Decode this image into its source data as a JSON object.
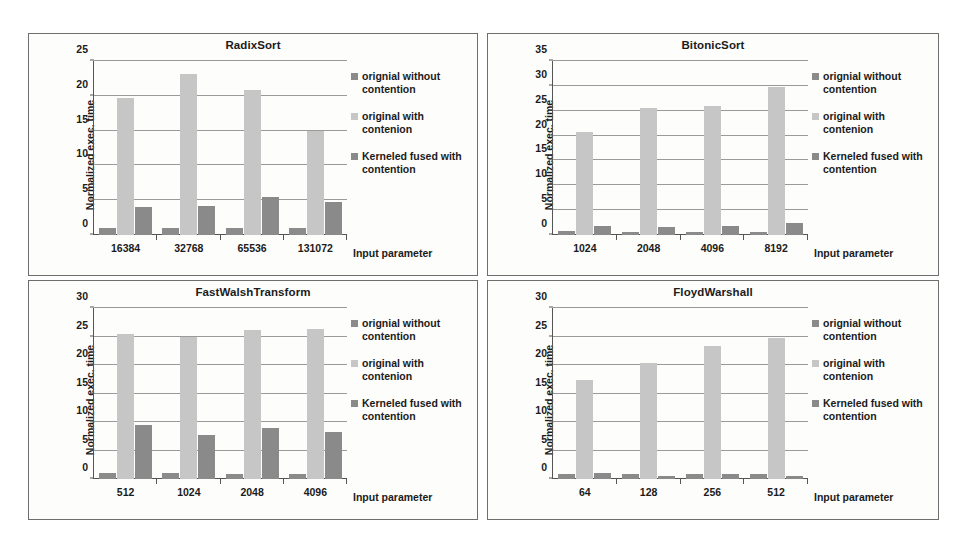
{
  "figure": {
    "panel_count": 4,
    "background_color": "#ffffff",
    "border_color": "#6e6e6e"
  },
  "legend": {
    "position": "right",
    "series": [
      {
        "label": "orignial without contention",
        "color": "#8b8b8b",
        "swatch_name": "legend-swatch-original-without-contention"
      },
      {
        "label": "original with contenion",
        "color": "#c6c6c6",
        "swatch_name": "legend-swatch-original-with-contention"
      },
      {
        "label": "Kerneled fused with contention",
        "color": "#8a8a8a",
        "swatch_name": "legend-swatch-kerneled-fused-with-contention"
      }
    ]
  },
  "chart_data": [
    {
      "type": "bar",
      "title": "RadixSort",
      "xlabel": "Input parameter",
      "ylabel": "Normalized exec. time",
      "categories": [
        "16384",
        "32768",
        "65536",
        "131072"
      ],
      "ylim": [
        0,
        25
      ],
      "yticks": [
        0,
        5,
        10,
        15,
        20,
        25
      ],
      "grid": true,
      "legend_position": "right",
      "series": [
        {
          "name": "orignial without contention",
          "color": "#8b8b8b",
          "values": [
            1.0,
            1.0,
            1.0,
            1.0
          ]
        },
        {
          "name": "original with contenion",
          "color": "#c6c6c6",
          "values": [
            19.7,
            23.1,
            20.9,
            14.9
          ]
        },
        {
          "name": "Kerneled fused with contention",
          "color": "#8a8a8a",
          "values": [
            4.0,
            4.2,
            5.5,
            4.8
          ]
        }
      ]
    },
    {
      "type": "bar",
      "title": "BitonicSort",
      "xlabel": "Input parameter",
      "ylabel": "Normalized exec. time",
      "categories": [
        "1024",
        "2048",
        "4096",
        "8192"
      ],
      "ylim": [
        0,
        35
      ],
      "yticks": [
        0,
        5,
        10,
        15,
        20,
        25,
        30,
        35
      ],
      "grid": true,
      "legend_position": "right",
      "series": [
        {
          "name": "orignial without contention",
          "color": "#8b8b8b",
          "values": [
            0.8,
            0.7,
            0.7,
            0.6
          ]
        },
        {
          "name": "original with contenion",
          "color": "#c6c6c6",
          "values": [
            20.7,
            25.5,
            25.9,
            29.8
          ]
        },
        {
          "name": "Kerneled fused with contention",
          "color": "#8a8a8a",
          "values": [
            1.8,
            1.7,
            1.9,
            2.5
          ]
        }
      ]
    },
    {
      "type": "bar",
      "title": "FastWalshTransform",
      "xlabel": "Input parameter",
      "ylabel": "Normalized exec. time",
      "categories": [
        "512",
        "1024",
        "2048",
        "4096"
      ],
      "ylim": [
        0,
        30
      ],
      "yticks": [
        0,
        5,
        10,
        15,
        20,
        25,
        30
      ],
      "grid": true,
      "legend_position": "right",
      "series": [
        {
          "name": "orignial without contention",
          "color": "#8b8b8b",
          "values": [
            1.0,
            1.0,
            0.95,
            0.85
          ]
        },
        {
          "name": "original with contenion",
          "color": "#c6c6c6",
          "values": [
            25.4,
            24.9,
            26.2,
            26.4
          ]
        },
        {
          "name": "Kerneled fused with contention",
          "color": "#8a8a8a",
          "values": [
            9.4,
            7.8,
            8.9,
            8.2
          ]
        }
      ]
    },
    {
      "type": "bar",
      "title": "FloydWarshall",
      "xlabel": "Input parameter",
      "ylabel": "Normalized exec. time",
      "categories": [
        "64",
        "128",
        "256",
        "512"
      ],
      "ylim": [
        0,
        30
      ],
      "yticks": [
        0,
        5,
        10,
        15,
        20,
        25,
        30
      ],
      "grid": true,
      "legend_position": "right",
      "series": [
        {
          "name": "orignial without contention",
          "color": "#8b8b8b",
          "values": [
            0.9,
            0.8,
            0.85,
            0.8
          ]
        },
        {
          "name": "original with contenion",
          "color": "#c6c6c6",
          "values": [
            17.3,
            20.3,
            23.3,
            24.8
          ]
        },
        {
          "name": "Kerneled fused with contention",
          "color": "#8a8a8a",
          "values": [
            1.05,
            0.6,
            0.9,
            0.5
          ]
        }
      ]
    }
  ]
}
